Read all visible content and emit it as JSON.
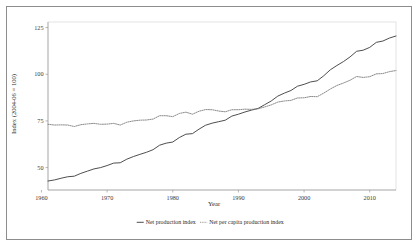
{
  "chart_data": {
    "type": "line",
    "title": "",
    "xlabel": "Year",
    "ylabel": "Index (2004-06 = 100)",
    "xlim": [
      1961,
      2014
    ],
    "ylim": [
      38,
      128
    ],
    "xticks": [
      1960,
      1970,
      1980,
      1990,
      2000,
      2010
    ],
    "xticklabels": [
      "1960",
      "1970",
      "1980",
      "1990",
      "2000",
      "2010"
    ],
    "yticks": [
      50,
      75,
      100,
      125
    ],
    "yticklabels": [
      "50",
      "75",
      "100",
      "125"
    ],
    "grid": false,
    "legend_position": "bottom",
    "x": [
      1961,
      1962,
      1963,
      1964,
      1965,
      1966,
      1967,
      1968,
      1969,
      1970,
      1971,
      1972,
      1973,
      1974,
      1975,
      1976,
      1977,
      1978,
      1979,
      1980,
      1981,
      1982,
      1983,
      1984,
      1985,
      1986,
      1987,
      1988,
      1989,
      1990,
      1991,
      1992,
      1993,
      1994,
      1995,
      1996,
      1997,
      1998,
      1999,
      2000,
      2001,
      2002,
      2003,
      2004,
      2005,
      2006,
      2007,
      2008,
      2009,
      2010,
      2011,
      2012,
      2013,
      2014
    ],
    "series": [
      {
        "name": "Net production index",
        "style": "solid",
        "color": "#3a3a3a",
        "values": [
          42.8,
          43.4,
          44.3,
          45.1,
          45.4,
          46.9,
          48.1,
          49.3,
          50.0,
          51.1,
          52.4,
          52.6,
          54.5,
          55.9,
          57.1,
          58.2,
          59.6,
          62.0,
          63.1,
          63.7,
          66.1,
          67.9,
          68.2,
          70.6,
          72.7,
          73.8,
          74.6,
          75.4,
          77.6,
          78.6,
          79.8,
          80.8,
          81.7,
          83.7,
          85.7,
          88.3,
          89.9,
          91.3,
          93.6,
          94.6,
          95.9,
          96.5,
          99.2,
          102.4,
          104.7,
          106.8,
          109.3,
          112.3,
          112.9,
          114.4,
          117.1,
          117.8,
          119.4,
          120.5
        ]
      },
      {
        "name": "Net per capita production index",
        "style": "dotted",
        "color": "#7e7e7e",
        "values": [
          73.2,
          72.8,
          72.9,
          72.8,
          72.0,
          73.0,
          73.4,
          73.7,
          73.2,
          73.3,
          73.7,
          72.8,
          74.3,
          75.0,
          75.4,
          75.5,
          76.0,
          77.8,
          77.8,
          77.3,
          79.0,
          79.7,
          78.6,
          80.2,
          81.1,
          81.0,
          80.3,
          79.9,
          81.0,
          81.0,
          81.3,
          81.2,
          81.5,
          82.5,
          83.6,
          85.1,
          85.7,
          86.0,
          87.3,
          87.4,
          88.1,
          88.0,
          89.9,
          92.1,
          94.0,
          95.3,
          96.8,
          98.8,
          98.3,
          98.7,
          100.2,
          100.4,
          101.4,
          102.0
        ]
      }
    ]
  },
  "legend": {
    "entries": [
      {
        "label": "Net production index"
      },
      {
        "label": "Net per capita production index"
      }
    ]
  },
  "axes": {
    "x_title": "Year",
    "y_title": "Index (2004-06 = 100)"
  }
}
